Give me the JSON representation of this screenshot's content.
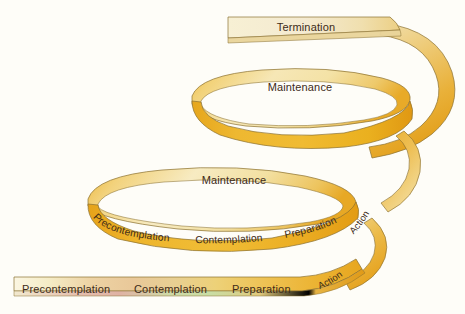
{
  "figure": {
    "name": "spiral-model-of-change",
    "background_color": "#fefdf8",
    "width": 465,
    "height": 314
  },
  "palette": {
    "pale_cream": "#f6efd2",
    "cream": "#f3e4b0",
    "light_gold": "#f0d78a",
    "gold": "#edc255",
    "deep_gold": "#e8a823",
    "amber": "#e09a16",
    "edge_line": "#8a7030",
    "label_color": "#3d2b18",
    "pink_tint": "#e9c9bd",
    "green_tint": "#cfe0b0"
  },
  "bands": [
    {
      "id": "band-termination",
      "kind": "top-straight",
      "labels": [
        {
          "text": "Termination",
          "name": "label-termination"
        }
      ]
    },
    {
      "id": "band-loop-upper",
      "kind": "loop",
      "labels": [
        {
          "text": "Maintenance",
          "name": "label-maintenance-upper"
        }
      ]
    },
    {
      "id": "band-loop-lower",
      "kind": "loop",
      "labels": [
        {
          "text": "Maintenance",
          "name": "label-maintenance-lower"
        },
        {
          "text": "Precontemplation",
          "name": "label-precontemplation-loop"
        },
        {
          "text": "Contemplation",
          "name": "label-contemplation-loop"
        },
        {
          "text": "Preparation",
          "name": "label-preparation-loop"
        },
        {
          "text": "Action",
          "name": "label-action-loop"
        }
      ]
    },
    {
      "id": "band-bottom",
      "kind": "bottom-straight",
      "labels": [
        {
          "text": "Precontemplation",
          "name": "label-precontemplation-bottom"
        },
        {
          "text": "Contemplation",
          "name": "label-contemplation-bottom"
        },
        {
          "text": "Preparation",
          "name": "label-preparation-bottom"
        },
        {
          "text": "Action",
          "name": "label-action-bottom"
        }
      ]
    }
  ],
  "labels": {
    "termination": "Termination",
    "maintenance_upper": "Maintenance",
    "maintenance_lower": "Maintenance",
    "precontemplation_loop": "Precontemplation",
    "contemplation_loop": "Contemplation",
    "preparation_loop": "Preparation",
    "action_loop": "Action",
    "precontemplation_bottom": "Precontemplation",
    "contemplation_bottom": "Contemplation",
    "preparation_bottom": "Preparation",
    "action_bottom": "Action"
  }
}
